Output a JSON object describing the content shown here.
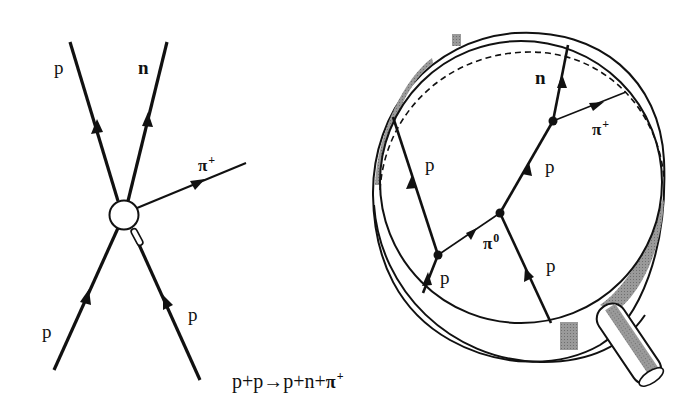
{
  "figure": {
    "left_diagram": {
      "title": "Interaction vertex diagram",
      "labels": {
        "outgoing_proton": "p",
        "outgoing_neutron": "n",
        "outgoing_pion_base": "π",
        "outgoing_pion_charge": "+",
        "incoming_proton_left": "p",
        "incoming_proton_right": "p"
      }
    },
    "right_diagram": {
      "title": "Detector ring event diagram",
      "labels": {
        "neutron": "n",
        "pion_plus_base": "π",
        "pion_plus_charge": "+",
        "proton_upper_right": "p",
        "proton_left_track": "p",
        "pion_zero_base": "π",
        "pion_zero_charge": "0",
        "proton_lower_right": "p",
        "proton_lower_left": "p"
      }
    },
    "equation": {
      "terms": [
        "p",
        "+",
        "p",
        "→",
        "p",
        "+",
        "n",
        "+",
        "π"
      ],
      "final_superscript": "+",
      "text": "p+p→p+n+π+"
    },
    "colors": {
      "line": "#111111",
      "shading": "#8a8a8a",
      "background": "#ffffff"
    }
  }
}
